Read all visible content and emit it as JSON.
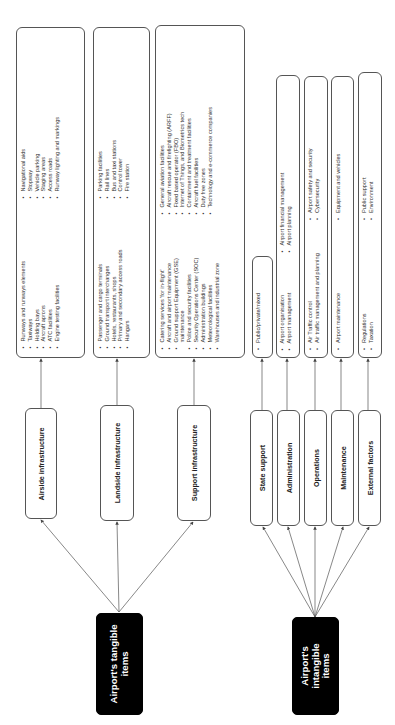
{
  "orientation": "rotated-90-ccw",
  "colors": {
    "root_fill": "#000000",
    "root_text": "#ffffff",
    "box_border": "#555555",
    "line": "#444444"
  },
  "tangible": {
    "root_label_line1": "Airport's tangible",
    "root_label_line2": "items",
    "categories": [
      {
        "label": "Airside infrastructure",
        "col1": [
          "Runways and runways elements",
          "Taxiways",
          "Holding bays",
          "Aircraft aprons",
          "ATC facilities",
          "Engine testing facilities"
        ],
        "col2": [
          "Navigational aids",
          "Stopway",
          "Vehicle parking",
          "Staging areas",
          "Access roads",
          "Runway lighting and markings"
        ]
      },
      {
        "label": "Landside infrastructure",
        "col1": [
          "Passenger and cargo terminals",
          "Ground transport interchanges",
          "Hotels, restaurants, shops",
          "Primary and secondary access roads",
          "Hangars"
        ],
        "col2": [
          "Parking facilities",
          "Rail lines",
          "Bus and taxi stations",
          "Control tower",
          "Fire station"
        ]
      },
      {
        "label": "Support infrastructure",
        "col1": [
          "Catering services 'for in-flight'",
          "Aircraft and airport maintenance",
          "Ground support Equipment (GSE)",
          "maintenance",
          "Police and security facilities",
          "Security Operations Center (SOC)",
          "Administration buildings",
          "Meteorological facilities",
          "Warehouses and industrial zone"
        ],
        "col2": [
          "General aviation facilities",
          "Aircraft rescue and firefighting (ARFF)",
          "Fixed based operator (FBO)",
          "Internet of Things, and Biometrics tech",
          "Containment and treatment facilities",
          "Aircraft fuel facilities",
          "Duty free zones",
          "Technology and e-commerce companies"
        ]
      }
    ]
  },
  "intangible": {
    "root_label_line1": "Airport's",
    "root_label_line2": "intangible",
    "root_label_line3": "items",
    "categories": [
      {
        "label": "State support",
        "col1": [
          "Public/private/mixed"
        ],
        "col2": []
      },
      {
        "label": "Administration",
        "col1": [
          "Airport organisation",
          "Airport management"
        ],
        "col2": [
          "Airport financial management",
          "Airport planning"
        ]
      },
      {
        "label": "Operations",
        "col1": [
          "Air Traffic control",
          "Air traffic management and planning"
        ],
        "col2": [
          "Airport safety and security",
          "Cybersecurity"
        ]
      },
      {
        "label": "Maintenance",
        "col1": [
          "Airport maintenance"
        ],
        "col2": [
          "Equipment and vehicles"
        ]
      },
      {
        "label": "External factors",
        "col1": [
          "Regulations",
          "Taxation"
        ],
        "col2": [
          "Public support",
          "Environment"
        ]
      }
    ]
  }
}
